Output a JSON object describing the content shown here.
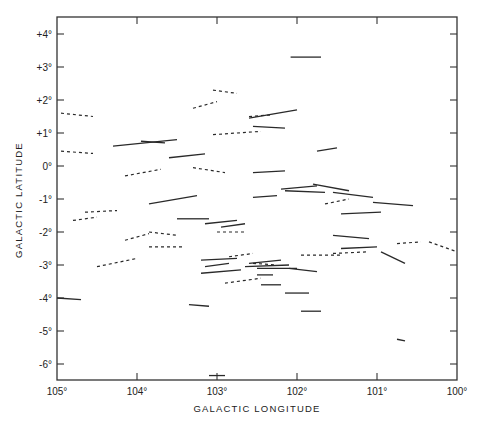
{
  "chart_data": {
    "type": "scatter",
    "subtype": "polarization-vector-map",
    "title": "",
    "xlabel": "GALACTIC LONGITUDE",
    "ylabel": "GALACTIC LATITUDE",
    "xlim": [
      105,
      100
    ],
    "ylim": [
      -6.5,
      4.5
    ],
    "x_ticks": [
      "105°",
      "104°",
      "103°",
      "102°",
      "101°",
      "100°"
    ],
    "y_ticks": [
      "+4°",
      "+3°",
      "+2°",
      "+1°",
      "0°",
      "-1°",
      "-2°",
      "-3°",
      "-4°",
      "-5°",
      "-6°"
    ],
    "grid": false,
    "legend": null,
    "series": [
      {
        "name": "solid segments",
        "style": "solid",
        "segments": [
          [
            [
              102.08,
              3.3
            ],
            [
              101.7,
              3.3
            ]
          ],
          [
            [
              104.3,
              0.6
            ],
            [
              103.5,
              0.8
            ]
          ],
          [
            [
              103.95,
              0.75
            ],
            [
              103.65,
              0.7
            ]
          ],
          [
            [
              103.6,
              0.25
            ],
            [
              103.15,
              0.37
            ]
          ],
          [
            [
              102.6,
              1.45
            ],
            [
              102.0,
              1.7
            ]
          ],
          [
            [
              102.55,
              1.2
            ],
            [
              102.15,
              1.15
            ]
          ],
          [
            [
              102.55,
              -0.2
            ],
            [
              102.15,
              -0.15
            ]
          ],
          [
            [
              101.75,
              0.45
            ],
            [
              101.5,
              0.55
            ]
          ],
          [
            [
              103.85,
              -1.15
            ],
            [
              103.25,
              -0.9
            ]
          ],
          [
            [
              103.5,
              -1.6
            ],
            [
              103.1,
              -1.6
            ]
          ],
          [
            [
              103.15,
              -1.75
            ],
            [
              102.75,
              -1.65
            ]
          ],
          [
            [
              102.95,
              -1.85
            ],
            [
              102.65,
              -1.75
            ]
          ],
          [
            [
              102.55,
              -0.95
            ],
            [
              102.25,
              -0.9
            ]
          ],
          [
            [
              102.2,
              -0.7
            ],
            [
              101.75,
              -0.6
            ]
          ],
          [
            [
              102.15,
              -0.75
            ],
            [
              101.65,
              -0.8
            ]
          ],
          [
            [
              101.8,
              -0.55
            ],
            [
              101.35,
              -0.75
            ]
          ],
          [
            [
              101.55,
              -0.8
            ],
            [
              101.05,
              -0.95
            ]
          ],
          [
            [
              101.05,
              -1.1
            ],
            [
              100.55,
              -1.2
            ]
          ],
          [
            [
              101.45,
              -1.45
            ],
            [
              100.95,
              -1.4
            ]
          ],
          [
            [
              101.55,
              -2.1
            ],
            [
              101.1,
              -2.2
            ]
          ],
          [
            [
              101.45,
              -2.5
            ],
            [
              101.0,
              -2.45
            ]
          ],
          [
            [
              100.95,
              -2.6
            ],
            [
              100.65,
              -2.95
            ]
          ],
          [
            [
              103.2,
              -2.85
            ],
            [
              102.75,
              -2.8
            ]
          ],
          [
            [
              103.15,
              -3.05
            ],
            [
              102.85,
              -2.95
            ]
          ],
          [
            [
              103.2,
              -3.25
            ],
            [
              102.7,
              -3.15
            ]
          ],
          [
            [
              102.6,
              -2.95
            ],
            [
              102.2,
              -2.85
            ]
          ],
          [
            [
              102.65,
              -3.05
            ],
            [
              102.1,
              -3.0
            ]
          ],
          [
            [
              102.5,
              -3.1
            ],
            [
              102.0,
              -3.1
            ]
          ],
          [
            [
              102.1,
              -3.1
            ],
            [
              101.75,
              -3.2
            ]
          ],
          [
            [
              102.5,
              -3.3
            ],
            [
              102.3,
              -3.3
            ]
          ],
          [
            [
              102.45,
              -3.6
            ],
            [
              102.2,
              -3.6
            ]
          ],
          [
            [
              102.15,
              -3.85
            ],
            [
              101.85,
              -3.85
            ]
          ],
          [
            [
              101.95,
              -4.4
            ],
            [
              101.7,
              -4.4
            ]
          ],
          [
            [
              103.35,
              -4.2
            ],
            [
              103.1,
              -4.25
            ]
          ],
          [
            [
              100.75,
              -5.25
            ],
            [
              100.65,
              -5.3
            ]
          ],
          [
            [
              103.1,
              -6.35
            ],
            [
              102.9,
              -6.35
            ]
          ],
          [
            [
              105.0,
              -4.0
            ],
            [
              104.7,
              -4.05
            ]
          ]
        ]
      },
      {
        "name": "dashed segments",
        "style": "dashed",
        "segments": [
          [
            [
              104.95,
              1.6
            ],
            [
              104.55,
              1.5
            ]
          ],
          [
            [
              104.95,
              0.45
            ],
            [
              104.55,
              0.38
            ]
          ],
          [
            [
              104.15,
              -0.3
            ],
            [
              103.7,
              -0.1
            ]
          ],
          [
            [
              103.3,
              1.75
            ],
            [
              103.0,
              1.95
            ]
          ],
          [
            [
              103.05,
              2.3
            ],
            [
              102.75,
              2.2
            ]
          ],
          [
            [
              103.05,
              0.95
            ],
            [
              102.45,
              1.05
            ]
          ],
          [
            [
              102.6,
              1.5
            ],
            [
              102.3,
              1.55
            ]
          ],
          [
            [
              103.3,
              -0.05
            ],
            [
              102.9,
              -0.2
            ]
          ],
          [
            [
              104.8,
              -1.65
            ],
            [
              104.5,
              -1.55
            ]
          ],
          [
            [
              104.65,
              -1.4
            ],
            [
              104.25,
              -1.35
            ]
          ],
          [
            [
              104.15,
              -2.25
            ],
            [
              103.85,
              -2.05
            ]
          ],
          [
            [
              103.85,
              -2.0
            ],
            [
              103.5,
              -2.1
            ]
          ],
          [
            [
              103.85,
              -2.45
            ],
            [
              103.4,
              -2.45
            ]
          ],
          [
            [
              104.5,
              -3.05
            ],
            [
              104.0,
              -2.8
            ]
          ],
          [
            [
              103.0,
              -2.0
            ],
            [
              102.65,
              -2.0
            ]
          ],
          [
            [
              102.85,
              -2.75
            ],
            [
              102.55,
              -2.65
            ]
          ],
          [
            [
              102.55,
              -2.95
            ],
            [
              102.25,
              -3.0
            ]
          ],
          [
            [
              102.9,
              -3.55
            ],
            [
              102.45,
              -3.4
            ]
          ],
          [
            [
              101.65,
              -1.15
            ],
            [
              101.35,
              -1.0
            ]
          ],
          [
            [
              101.95,
              -2.7
            ],
            [
              101.45,
              -2.7
            ]
          ],
          [
            [
              101.55,
              -2.65
            ],
            [
              101.1,
              -2.6
            ]
          ],
          [
            [
              100.75,
              -2.35
            ],
            [
              100.45,
              -2.3
            ]
          ],
          [
            [
              100.35,
              -2.3
            ],
            [
              100.0,
              -2.6
            ]
          ]
        ]
      }
    ]
  },
  "axes": {
    "x_title": "GALACTIC LONGITUDE",
    "y_title": "GALACTIC LATITUDE"
  }
}
